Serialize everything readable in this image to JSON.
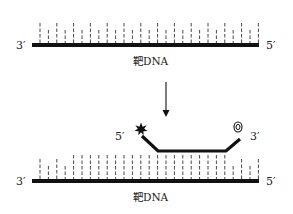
{
  "diagram": {
    "top": {
      "left_end": "3′",
      "right_end": "5′",
      "strand_label": "靶DNA"
    },
    "probe": {
      "left_end": "5′",
      "right_end": "3′",
      "fluorophore_icon": "star-burst-icon",
      "quencher_icon": "concentric-ring-icon"
    },
    "bottom": {
      "left_end": "3′",
      "right_end": "5′",
      "strand_label": "靶DNA"
    },
    "colors": {
      "strand": "#111111",
      "tick": "#333333",
      "background": "#ffffff"
    }
  }
}
